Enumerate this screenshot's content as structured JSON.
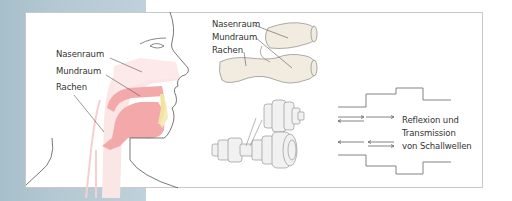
{
  "figure": {
    "head_section": {
      "labels": [
        "Nasenraum",
        "Mundraum",
        "Rachen"
      ]
    },
    "model_section": {
      "labels": [
        "Nasenraum",
        "Mundraum",
        "Rachen"
      ]
    },
    "tube_section": {
      "caption_lines": [
        "Reflexion und",
        "Transmission",
        "von Schallwellen"
      ]
    },
    "colors": {
      "background_strip": "#b4c9d3",
      "tract_fill": "#f4a8a8",
      "tract_light": "#fbe3e3",
      "teeth": "#f3e3a0",
      "model_fill": "#f2ece0",
      "line": "#555555"
    }
  }
}
